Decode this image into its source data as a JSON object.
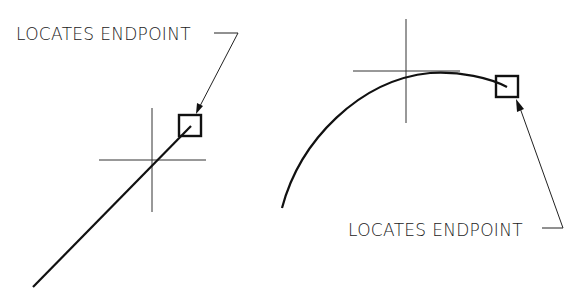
{
  "diagram": {
    "left_figure": {
      "label": "LOCATES ENDPOINT",
      "object": "line",
      "snap_marker": "endpoint-box"
    },
    "right_figure": {
      "label": "LOCATES ENDPOINT",
      "object": "arc",
      "snap_marker": "endpoint-box"
    },
    "colors": {
      "stroke": "#111111",
      "thin_stroke": "#333333",
      "background": "#ffffff"
    }
  }
}
